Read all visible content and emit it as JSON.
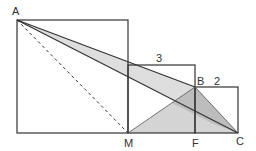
{
  "diagram": {
    "labels": {
      "A": "A",
      "B": "B",
      "C": "C",
      "M": "M",
      "F": "F"
    },
    "dimensions": {
      "middle_square_side": "3",
      "small_square_side": "2"
    },
    "colors": {
      "stroke": "#333333",
      "shade_light": "#dcdcdc",
      "shade_dark": "#b8b8b8"
    }
  }
}
